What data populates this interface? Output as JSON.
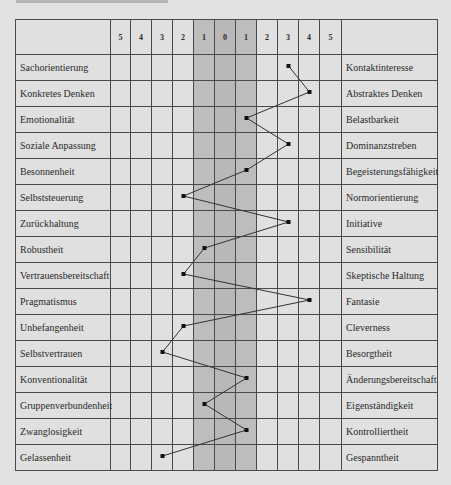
{
  "chart_data": {
    "type": "line",
    "title": "",
    "scale_labels": [
      "5",
      "4",
      "3",
      "2",
      "1",
      "0",
      "1",
      "2",
      "3",
      "4",
      "5"
    ],
    "scale_values": [
      -5,
      -4,
      -3,
      -2,
      -1,
      0,
      1,
      2,
      3,
      4,
      5
    ],
    "shaded_band": [
      -1,
      1
    ],
    "rows": [
      {
        "left": "Sachorientierung",
        "right": "Kontaktinteresse",
        "value": 3
      },
      {
        "left": "Konkretes Denken",
        "right": "Abstraktes Denken",
        "value": 4
      },
      {
        "left": "Emotionalität",
        "right": "Belastbarkeit",
        "value": 1
      },
      {
        "left": "Soziale Anpassung",
        "right": "Dominanzstreben",
        "value": 3
      },
      {
        "left": "Besonnenheit",
        "right": "Begeisterungsfähigkeit",
        "value": 1
      },
      {
        "left": "Selbststeuerung",
        "right": "Normorientierung",
        "value": -2
      },
      {
        "left": "Zurückhaltung",
        "right": "Initiative",
        "value": 3
      },
      {
        "left": "Robustheit",
        "right": "Sensibilität",
        "value": -1
      },
      {
        "left": "Vertrauensbereitschaft",
        "right": "Skeptische Haltung",
        "value": -2
      },
      {
        "left": "Pragmatismus",
        "right": "Fantasie",
        "value": 4
      },
      {
        "left": "Unbefangenheit",
        "right": "Cleverness",
        "value": -2
      },
      {
        "left": "Selbstvertrauen",
        "right": "Besorgtheit",
        "value": -3
      },
      {
        "left": "Konventionalität",
        "right": "Änderungsbereitschaft",
        "value": 1
      },
      {
        "left": "Gruppenverbundenheit",
        "right": "Eigenständigkeit",
        "value": -1
      },
      {
        "left": "Zwanglosigkeit",
        "right": "Kontrolliertheit",
        "value": 1
      },
      {
        "left": "Gelassenheit",
        "right": "Gespanntheit",
        "value": -3
      }
    ],
    "xlabel": "",
    "ylabel": "",
    "xlim": [
      -5,
      5
    ],
    "grid": true,
    "legend": "none"
  },
  "colors": {
    "background": "#e2e2e2",
    "cell": "#e0e0e0",
    "shade": "#bdbdbd",
    "line": "#333333"
  }
}
